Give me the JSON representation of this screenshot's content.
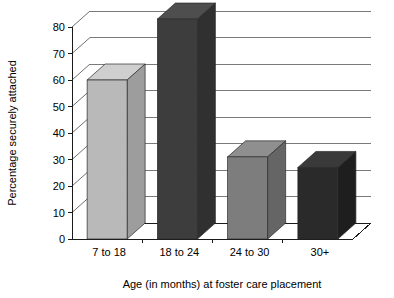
{
  "chart_data": {
    "type": "bar",
    "title": "",
    "subtitle": "",
    "categories": [
      "7 to 18",
      "18 to 24",
      "24 to 30",
      "30+"
    ],
    "values": [
      60,
      83,
      31,
      27
    ],
    "series": [
      {
        "name": "Percentage securely attached",
        "values": [
          60,
          83,
          31,
          27
        ]
      }
    ],
    "xlabel": "Age (in months) at foster care placement",
    "ylabel": "Percentage securely attached",
    "ylim": [
      0,
      80
    ],
    "ytick_step": 10,
    "yticks": [
      "0",
      "10",
      "20",
      "30",
      "40",
      "50",
      "60",
      "70",
      "80"
    ],
    "grid": true,
    "legend": false,
    "legend_position": "none",
    "style": "3d-column",
    "bar_colors": [
      "#b9b9b9",
      "#3d3d3d",
      "#7d7d7d",
      "#2a2a2a"
    ],
    "bar_side_colors": [
      "#9d9d9d",
      "#303030",
      "#656565",
      "#1e1e1e"
    ],
    "bar_top_colors": [
      "#cfcfcf",
      "#4e4e4e",
      "#8f8f8f",
      "#3a3a3a"
    ],
    "background_color": "#ffffff",
    "axis_color": "#1a1a1a",
    "grid_color": "#7a7a7a"
  },
  "axis": {
    "y_title": "Percentage securely attached",
    "x_title": "Age (in months) at foster care placement"
  }
}
